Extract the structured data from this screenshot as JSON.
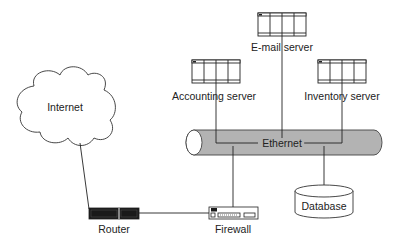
{
  "diagram": {
    "title": "",
    "nodes": {
      "internet": {
        "label": "Internet",
        "icon": "cloud-icon"
      },
      "router": {
        "label": "Router",
        "icon": "router-icon"
      },
      "firewall": {
        "label": "Firewall",
        "icon": "firewall-icon"
      },
      "ethernet": {
        "label": "Ethernet",
        "icon": "network-bus-icon"
      },
      "email_server": {
        "label": "E-mail server",
        "icon": "server-icon"
      },
      "accounting_server": {
        "label": "Accounting server",
        "icon": "server-icon"
      },
      "inventory_server": {
        "label": "Inventory server",
        "icon": "server-icon"
      },
      "database": {
        "label": "Database",
        "icon": "database-icon"
      }
    },
    "edges": [
      {
        "from": "Internet",
        "to": "Router"
      },
      {
        "from": "Router",
        "to": "Firewall"
      },
      {
        "from": "Firewall",
        "to": "Ethernet"
      },
      {
        "from": "E-mail server",
        "to": "Ethernet"
      },
      {
        "from": "Accounting server",
        "to": "Ethernet"
      },
      {
        "from": "Inventory server",
        "to": "Ethernet"
      },
      {
        "from": "Ethernet",
        "to": "Database"
      }
    ],
    "colors": {
      "line": "#222222",
      "pipe_fill": "#b0b0b0",
      "device_dark": "#1a1a1a",
      "background": "#ffffff"
    }
  }
}
